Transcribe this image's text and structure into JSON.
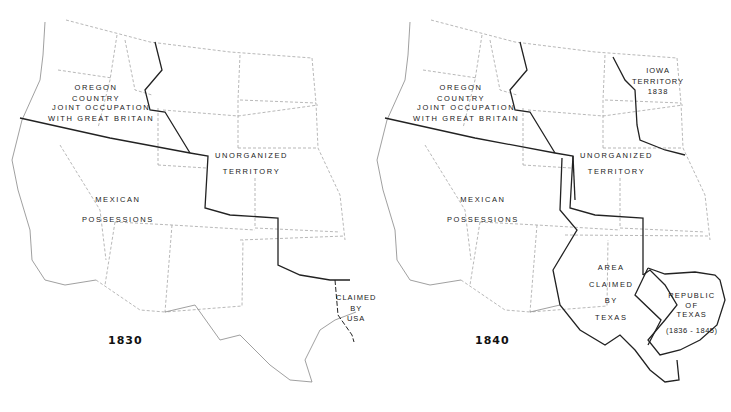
{
  "maps": [
    {
      "year": "1830",
      "labels": {
        "oregon_1": "OREGON",
        "oregon_2": "COUNTRY",
        "joint_1": "JOINT OCCUPATION",
        "joint_2": "WITH GREAT BRITAIN",
        "unorg_1": "UNORGANIZED",
        "unorg_2": "TERRITORY",
        "mexican_1": "MEXICAN",
        "mexican_2": "POSSESSIONS",
        "claimed_1": "CLAIMED",
        "claimed_2": "BY",
        "claimed_3": "USA"
      }
    },
    {
      "year": "1840",
      "labels": {
        "oregon_1": "OREGON",
        "oregon_2": "COUNTRY",
        "joint_1": "JOINT OCCUPATION",
        "joint_2": "WITH GREAT BRITAIN",
        "unorg_1": "UNORGANIZED",
        "unorg_2": "TERRITORY",
        "mexican_1": "MEXICAN",
        "mexican_2": "POSSESSIONS",
        "iowa_1": "IOWA",
        "iowa_2": "TERRITORY",
        "iowa_3": "1838",
        "area_1": "AREA",
        "area_2": "CLAIMED",
        "area_3": "BY",
        "area_4": "TEXAS",
        "rep_1": "REPUBLIC",
        "rep_2": "OF",
        "rep_3": "TEXAS",
        "rep_4": "(1836 - 1845)"
      }
    }
  ]
}
